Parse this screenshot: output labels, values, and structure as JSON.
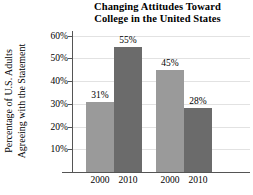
{
  "chart_data": {
    "type": "bar",
    "title": "Changing Attitudes Toward College in the United States",
    "title_lines": [
      "Changing Attitudes Toward",
      "College in the United States"
    ],
    "xlabel": "",
    "ylabel": "Percentage of U.S. Adults Agreeing with the Statement",
    "ylabel_lines": [
      "Percentage of U.S. Adults",
      "Agreeing with the Statement"
    ],
    "categories": [
      "2000",
      "2010",
      "2000",
      "2010"
    ],
    "values": [
      31,
      45,
      55,
      28
    ],
    "bars": [
      {
        "group": 1,
        "category": "2000",
        "value": 31,
        "label": "31%",
        "shade": "light"
      },
      {
        "group": 1,
        "category": "2010",
        "value": 55,
        "label": "55%",
        "shade": "dark"
      },
      {
        "group": 2,
        "category": "2000",
        "value": 45,
        "label": "45%",
        "shade": "light"
      },
      {
        "group": 2,
        "category": "2010",
        "value": 28,
        "label": "28%",
        "shade": "dark"
      }
    ],
    "ylim": [
      0,
      62
    ],
    "yticks": [
      10,
      20,
      30,
      40,
      50,
      60
    ],
    "ytick_labels": [
      "10%",
      "20%",
      "30%",
      "40%",
      "50%",
      "60%"
    ],
    "grid": true,
    "legend": "none",
    "colors": {
      "light_bar": "#9a9a9a",
      "dark_bar": "#6b6b6b",
      "gridline": "#e2e2e2",
      "axis": "#555555",
      "text": "#000000",
      "background": "#ffffff"
    }
  }
}
